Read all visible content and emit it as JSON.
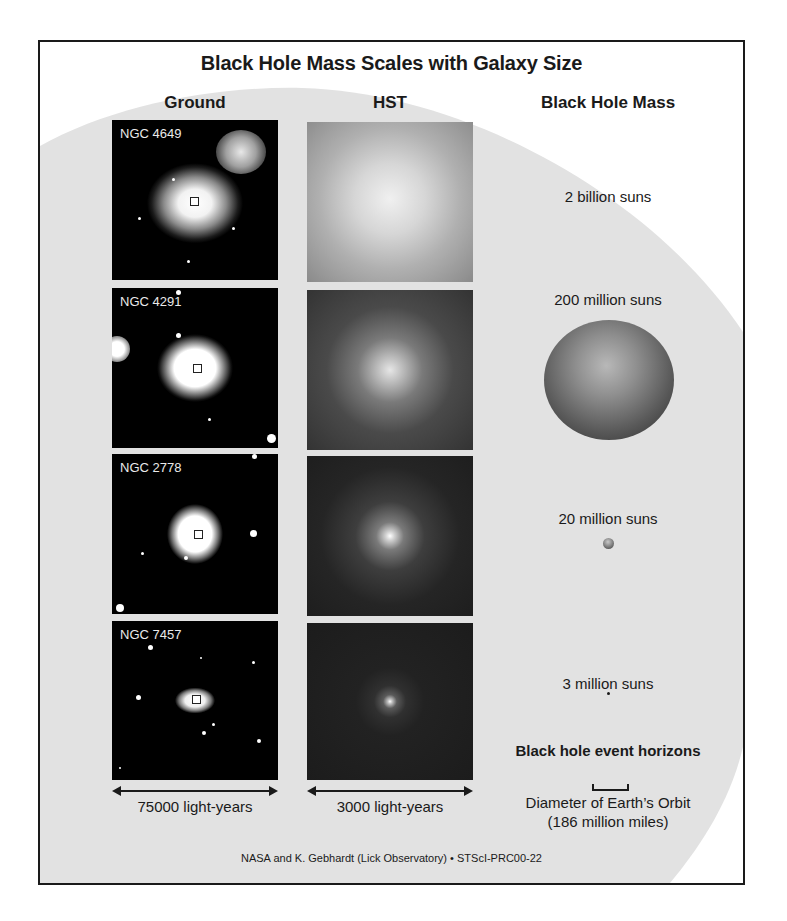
{
  "title": "Black Hole Mass Scales with Galaxy Size",
  "columns": {
    "ground": "Ground",
    "hst": "HST",
    "mass": "Black Hole Mass"
  },
  "galaxies": [
    {
      "name": "NGC 4649",
      "mass": "2 billion suns"
    },
    {
      "name": "NGC 4291",
      "mass": "200 million suns"
    },
    {
      "name": "NGC 2778",
      "mass": "20 million suns"
    },
    {
      "name": "NGC 7457",
      "mass": "3 million suns"
    }
  ],
  "scales": {
    "ground": "75000 light-years",
    "hst": "3000 light-years"
  },
  "legend": {
    "heading": "Black hole event horizons",
    "line1": "Diameter of Earth’s Orbit",
    "line2": "(186 million miles)"
  },
  "credit": "NASA and K. Gebhardt (Lick Observatory) • STScI-PRC00-22",
  "colors": {
    "background_shape": "#e2e2e2",
    "frame_border": "#1a1a1a",
    "text": "#1a1a1a"
  }
}
